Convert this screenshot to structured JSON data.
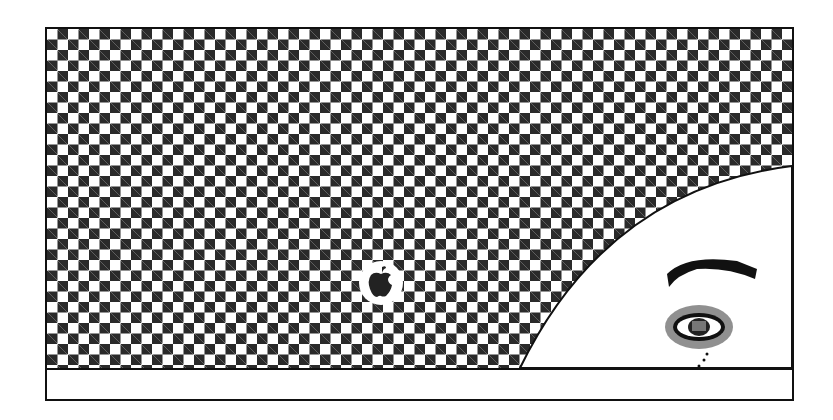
{
  "screen": {
    "title": "Startup screen",
    "pattern": "checkerboard",
    "colors": {
      "dark": "#2a2a2a",
      "light": "#ffffff",
      "border": "#111111"
    }
  },
  "icons": {
    "apple_logo": "apple-logo-icon",
    "face": "face-illustration"
  },
  "status_strip": {
    "text": ""
  }
}
